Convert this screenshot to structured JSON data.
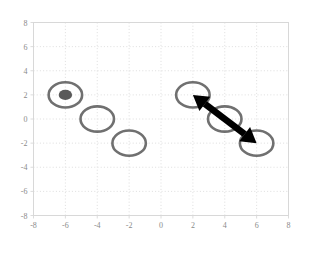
{
  "figure": {
    "background_color": "#ffffff",
    "axis_frame_color": "#d8d8d8",
    "grid_color": "#d5d5d5",
    "tick_label_color": "#8a8a8a"
  },
  "chart_data": {
    "type": "scatter",
    "title": "",
    "xlabel": "",
    "ylabel": "",
    "xlim": [
      -8,
      8
    ],
    "ylim": [
      -8,
      8
    ],
    "xticks": [
      -8,
      -6,
      -4,
      -2,
      0,
      2,
      4,
      6,
      8
    ],
    "yticks": [
      -8,
      -6,
      -4,
      -2,
      0,
      2,
      4,
      6,
      8
    ],
    "xtick_labels": [
      "-8",
      "-6",
      "-4",
      "-2",
      "0",
      "2",
      "4",
      "6",
      "8"
    ],
    "ytick_labels": [
      "-8",
      "-6",
      "-4",
      "-2",
      "0",
      "2",
      "4",
      "6",
      "8"
    ],
    "grid": true,
    "grid_style": "dotted",
    "legend": null,
    "series": [
      {
        "name": "left-group-circles",
        "marker": "open-circle",
        "marker_color": "#707070",
        "marker_radius_data": 1.05,
        "points": [
          {
            "x": -6,
            "y": 2
          },
          {
            "x": -4,
            "y": 0
          },
          {
            "x": -2,
            "y": -2
          }
        ]
      },
      {
        "name": "right-group-circles",
        "marker": "open-circle",
        "marker_color": "#707070",
        "marker_radius_data": 1.05,
        "points": [
          {
            "x": 2,
            "y": 2
          },
          {
            "x": 4,
            "y": 0
          },
          {
            "x": 6,
            "y": -2
          }
        ]
      },
      {
        "name": "highlighted-point",
        "marker": "filled-circle",
        "marker_color": "#595959",
        "marker_radius_data": 0.42,
        "points": [
          {
            "x": -6,
            "y": 2
          }
        ]
      }
    ],
    "annotations": [
      {
        "name": "double-headed-arrow",
        "type": "double-arrow",
        "color": "#000000",
        "line_width_data": 0.42,
        "start": {
          "x": 2,
          "y": 2
        },
        "end": {
          "x": 6,
          "y": -2
        }
      }
    ]
  }
}
